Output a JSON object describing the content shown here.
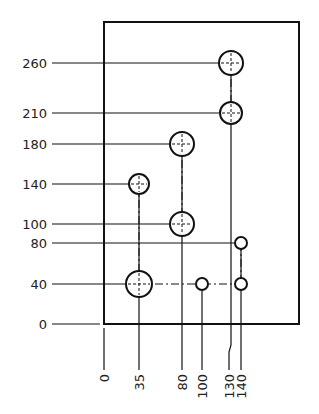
{
  "plate": {
    "x0": 0,
    "y0": 0,
    "label_origin_x": "0",
    "label_origin_y": "0"
  },
  "y_ordinates": [
    {
      "value": 260,
      "label": "260"
    },
    {
      "value": 210,
      "label": "210"
    },
    {
      "value": 180,
      "label": "180"
    },
    {
      "value": 140,
      "label": "140"
    },
    {
      "value": 100,
      "label": "100"
    },
    {
      "value": 80,
      "label": "80"
    },
    {
      "value": 40,
      "label": "40"
    },
    {
      "value": 0,
      "label": "0"
    }
  ],
  "x_ordinates": [
    {
      "value": 0,
      "label": "0"
    },
    {
      "value": 35,
      "label": "35"
    },
    {
      "value": 80,
      "label": "80"
    },
    {
      "value": 100,
      "label": "100"
    },
    {
      "value": 130,
      "label": "130"
    },
    {
      "value": 140,
      "label": "140"
    }
  ],
  "holes": [
    {
      "x": 35,
      "y": 40,
      "size": "large"
    },
    {
      "x": 100,
      "y": 40,
      "size": "small"
    },
    {
      "x": 140,
      "y": 40,
      "size": "small"
    },
    {
      "x": 140,
      "y": 80,
      "size": "small"
    },
    {
      "x": 80,
      "y": 100,
      "size": "large"
    },
    {
      "x": 35,
      "y": 140,
      "size": "medium"
    },
    {
      "x": 80,
      "y": 180,
      "size": "large"
    },
    {
      "x": 130,
      "y": 210,
      "size": "medium"
    },
    {
      "x": 130,
      "y": 260,
      "size": "large"
    }
  ],
  "colors": {
    "line": "#111111",
    "text": "#222222",
    "background": "#ffffff"
  }
}
